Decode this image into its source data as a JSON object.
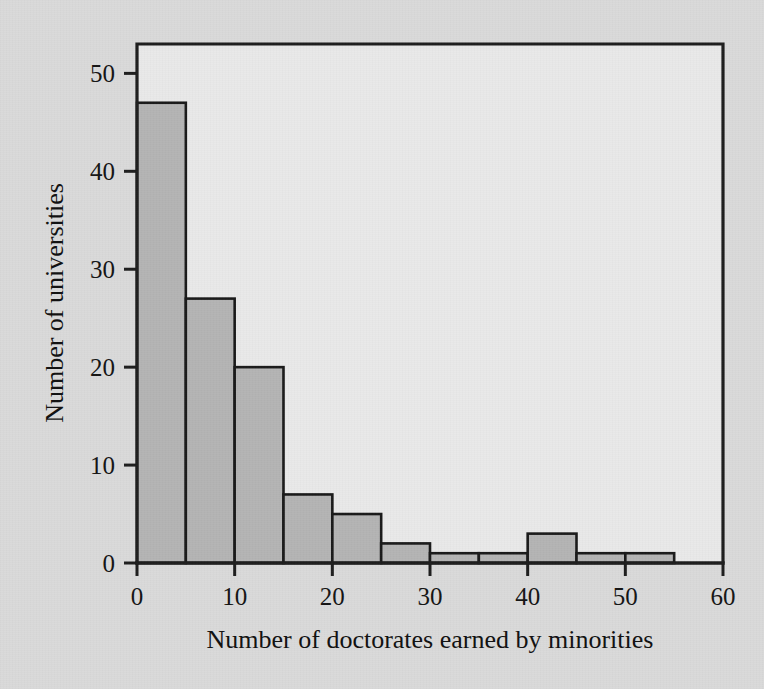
{
  "figure": {
    "background_color": "#dadada",
    "plot_background_color": "#e9e9e9",
    "bar_fill_color": "#b4b4b4",
    "bar_edge_color": "#191919",
    "axis_color": "#1d1d1d"
  },
  "chart_data": {
    "type": "bar",
    "title": "",
    "xlabel": "Number of doctorates earned by minorities",
    "ylabel": "Number of universities",
    "xlim": [
      0,
      60
    ],
    "ylim": [
      0,
      53
    ],
    "grid": false,
    "legend": null,
    "bin_width": 5,
    "bin_edges": [
      0,
      5,
      10,
      15,
      20,
      25,
      30,
      35,
      40,
      45,
      50,
      55,
      60
    ],
    "categories": [
      "0-5",
      "5-10",
      "10-15",
      "15-20",
      "20-25",
      "25-30",
      "30-35",
      "35-40",
      "40-45",
      "45-50",
      "50-55",
      "55-60"
    ],
    "values": [
      47,
      27,
      20,
      7,
      5,
      2,
      1,
      1,
      3,
      1,
      1,
      0
    ],
    "xticks": [
      0,
      10,
      20,
      30,
      40,
      50,
      60
    ],
    "xticklabels": [
      "0",
      "10",
      "20",
      "30",
      "40",
      "50",
      "60"
    ],
    "yticks": [
      0,
      10,
      20,
      30,
      40,
      50
    ],
    "yticklabels": [
      "0",
      "10",
      "20",
      "30",
      "40",
      "50"
    ]
  }
}
